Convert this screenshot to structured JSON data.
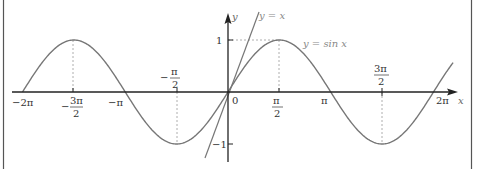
{
  "chart_data": {
    "type": "line",
    "title": "",
    "xlabel": "x",
    "ylabel": "y",
    "xlim": [
      -6.2832,
      6.2832
    ],
    "ylim": [
      -1,
      1
    ],
    "grid": false,
    "series": [
      {
        "name": "y = sin x",
        "function": "sin(x)",
        "color": "#777777",
        "key_points": [
          [
            -6.2832,
            0
          ],
          [
            -4.7124,
            1
          ],
          [
            -3.1416,
            0
          ],
          [
            -1.5708,
            -1
          ],
          [
            0,
            0
          ],
          [
            1.5708,
            1
          ],
          [
            3.1416,
            0
          ],
          [
            4.7124,
            -1
          ],
          [
            6.2832,
            0
          ]
        ]
      },
      {
        "name": "y = x",
        "function": "x",
        "color": "#777777",
        "key_points": [
          [
            -1.25,
            -1.25
          ],
          [
            1.6,
            1.6
          ]
        ]
      }
    ],
    "x_ticks": [
      "-2π",
      "-3π/2",
      "-π",
      "-π/2",
      "0",
      "π/2",
      "π",
      "3π/2",
      "2π"
    ],
    "y_ticks": [
      "1",
      "-1"
    ],
    "annotations": [
      "y = x",
      "y = sin x"
    ]
  },
  "labels": {
    "x_axis": "x",
    "y_axis": "y",
    "origin": "0",
    "y_one": "1",
    "y_minus_one": "−1",
    "neg_two_pi": "−2π",
    "neg_three_pi_half_num": "3π",
    "neg_three_pi_half_den": "2",
    "neg_three_pi_half_sign": "−",
    "neg_pi": "−π",
    "neg_pi_half_num": "π",
    "neg_pi_half_den": "2",
    "neg_pi_half_sign": "−",
    "pi_half_num": "π",
    "pi_half_den": "2",
    "pi": "π",
    "three_pi_half_num": "3π",
    "three_pi_half_den": "2",
    "two_pi": "2π",
    "line_label": "y = x",
    "curve_label": "y = sin x"
  },
  "colors": {
    "axis": "#222222",
    "curve": "#777777",
    "line": "#777777",
    "dashed": "#999999",
    "frame": "#555555"
  }
}
